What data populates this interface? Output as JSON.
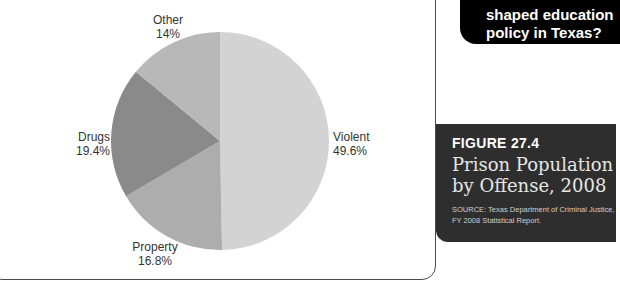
{
  "chart_data": {
    "type": "pie",
    "title": "Prison Population by Offense, 2008",
    "figure_number": "FIGURE 27.4",
    "source": "SOURCE: Texas Department of Criminal Justice, FY 2008 Statistical Report.",
    "categories": [
      "Violent",
      "Property",
      "Drugs",
      "Other"
    ],
    "values": [
      49.6,
      16.8,
      19.4,
      14
    ],
    "unit": "%",
    "start_angle": "12 o'clock",
    "direction": "clockwise",
    "colors": [
      "#d3d3d3",
      "#adadad",
      "#8a8a8a",
      "#b8b8b8"
    ],
    "labels": [
      {
        "name": "Violent",
        "value": "49.6%"
      },
      {
        "name": "Property",
        "value": "16.8%"
      },
      {
        "name": "Drugs",
        "value": "19.4%"
      },
      {
        "name": "Other",
        "value": "14%"
      }
    ],
    "legend": "none (direct labels)"
  },
  "sidebar": {
    "question_lines": [
      "shaped education",
      "policy in Texas?"
    ],
    "figure_number": "FIGURE 27.4",
    "figure_title_lines": [
      "Prison Population",
      "by Offense, 2008"
    ],
    "source_lines": [
      "SOURCE: Texas Department of Criminal Justice,",
      "FY 2008 Statistical Report."
    ]
  },
  "colors": {
    "question_box_bg": "#000000",
    "caption_box_bg": "#2e2e2e",
    "frame_border": "#4a4a4a"
  }
}
